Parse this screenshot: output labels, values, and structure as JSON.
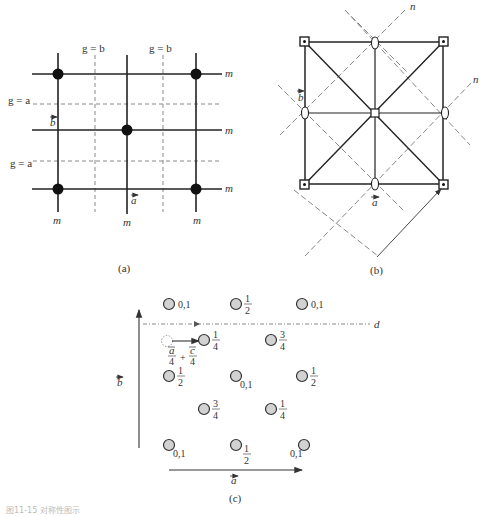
{
  "panels": {
    "a": {
      "caption": "(a)",
      "labels": {
        "gb1": "g = b",
        "gb2": "g = b",
        "ga1": "g = a",
        "ga2": "g = a",
        "m_right_top": "m",
        "m_right_mid": "m",
        "m_right_bot": "m",
        "m_bot_left": "m",
        "m_bot_mid": "m",
        "m_bot_right": "m",
        "vec_b": "b",
        "vec_a": "a"
      }
    },
    "b": {
      "caption": "(b)",
      "labels": {
        "n1": "n",
        "n2": "n",
        "vec_b": "b",
        "vec_a": "a"
      }
    },
    "c": {
      "caption": "(c)",
      "labels": {
        "glide": "d",
        "vec_b": "b",
        "vec_a": "a",
        "translation_a": "a",
        "translation_c": "c",
        "plus": "+",
        "four1": "4",
        "four2": "4"
      },
      "atoms": [
        {
          "label": "0,1"
        },
        {
          "num": "1",
          "den": "2"
        },
        {
          "label": "0,1"
        },
        {
          "num": "1",
          "den": "4"
        },
        {
          "num": "3",
          "den": "4"
        },
        {
          "num": "1",
          "den": "2"
        },
        {
          "label": "0,1"
        },
        {
          "num": "1",
          "den": "2"
        },
        {
          "num": "3",
          "den": "4"
        },
        {
          "num": "1",
          "den": "4"
        },
        {
          "label": "0,1"
        },
        {
          "num": "1",
          "den": "2"
        },
        {
          "label": "0,1"
        }
      ]
    }
  },
  "footer": "图11-15 对称性图示"
}
